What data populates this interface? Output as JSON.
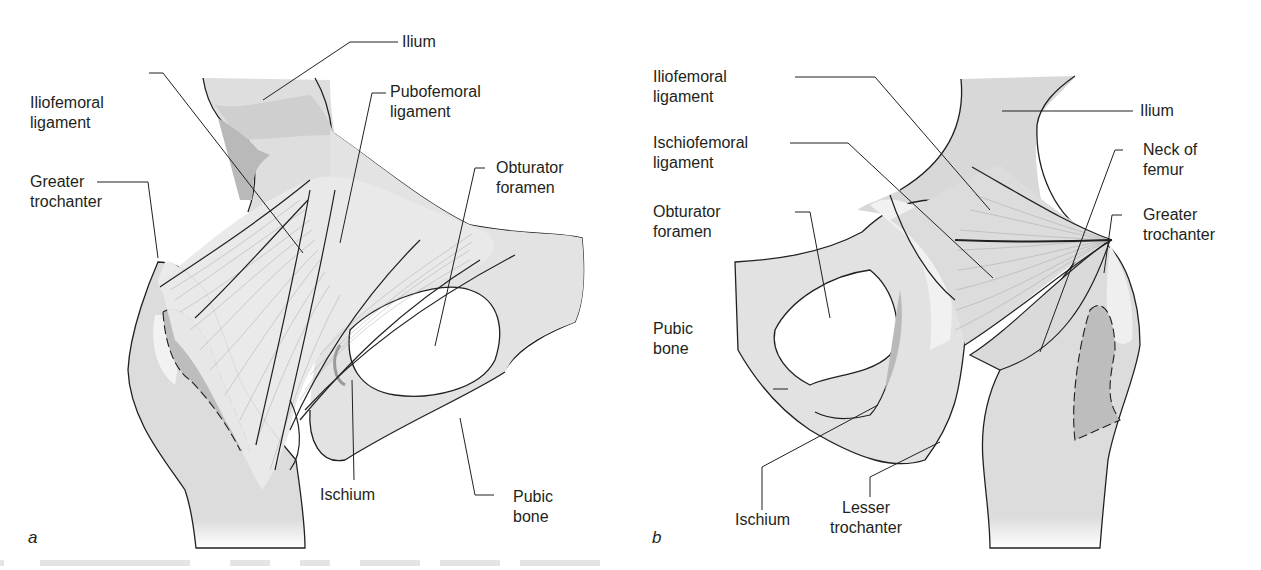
{
  "figure": {
    "panels": [
      {
        "id": "a",
        "letter": "a",
        "view": "anterior hip joint",
        "labels": {
          "ilium": "Ilium",
          "pubofemoral": "Pubofemoral\nligament",
          "iliofemoral": "Iliofemoral\nligament",
          "greater_trochanter": "Greater\ntrochanter",
          "obturator_foramen": "Obturator\nforamen",
          "ischium": "Ischium",
          "pubic_bone": "Pubic\nbone"
        }
      },
      {
        "id": "b",
        "letter": "b",
        "view": "posterior hip joint",
        "labels": {
          "iliofemoral": "Iliofemoral\nligament",
          "ilium": "Ilium",
          "ischiofemoral": "Ischiofemoral\nligament",
          "neck_of_femur": "Neck of\nfemur",
          "obturator_foramen": "Obturator\nforamen",
          "greater_trochanter": "Greater\ntrochanter",
          "pubic_bone": "Pubic\nbone",
          "ischium": "Ischium",
          "lesser_trochanter": "Lesser\ntrochanter"
        }
      }
    ],
    "colors": {
      "bone_light": "#e6e6e6",
      "bone_mid": "#d2d2d2",
      "bone_dark": "#b4b4b4",
      "highlight": "#f2f2f2",
      "outline": "#231f20",
      "text": "#231f20"
    }
  }
}
